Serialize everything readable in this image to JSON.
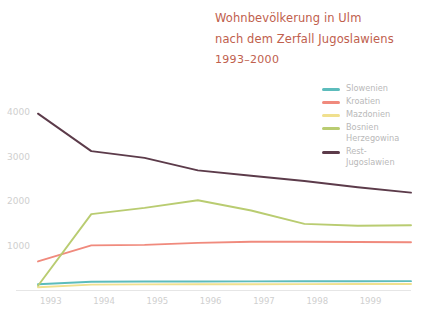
{
  "title": {
    "line1": "Wohnbevölkerung in Ulm",
    "line2": "nach dem Zerfall Jugoslawiens",
    "subtitle": "1993–2000",
    "color": "#c0604d"
  },
  "legend": {
    "position": "top-right",
    "entries": [
      {
        "label": "Slowenien",
        "color": "#5cbcbc"
      },
      {
        "label": "Kroatien",
        "color": "#f08a7d"
      },
      {
        "label": "Mazdonien",
        "color": "#f0e08e"
      },
      {
        "label": "Bosnien\nHerzegowina",
        "color": "#b9cc71"
      },
      {
        "label": "Rest-\nJugoslawien",
        "color": "#5c3b4a"
      }
    ]
  },
  "axes": {
    "y_ticks": [
      "1000",
      "2000",
      "3000",
      "4000"
    ],
    "x_ticks": [
      "1993",
      "1994",
      "1995",
      "1996",
      "1997",
      "1998",
      "1999"
    ],
    "ylim": [
      0,
      4300
    ],
    "xlim": [
      1993,
      2000
    ],
    "grid": false
  },
  "chart_data": {
    "type": "line",
    "title": "Wohnbevölkerung in Ulm nach dem Zerfall Jugoslawiens 1993–2000",
    "xlabel": "",
    "ylabel": "",
    "ylim": [
      0,
      4300
    ],
    "grid": false,
    "legend_position": "top-right",
    "x": [
      1993,
      1994,
      1995,
      1996,
      1997,
      1998,
      1999,
      2000
    ],
    "series": [
      {
        "name": "Slowenien",
        "color": "#5cbcbc",
        "values": [
          130,
          185,
          190,
          192,
          193,
          195,
          196,
          198
        ]
      },
      {
        "name": "Kroatien",
        "color": "#f08a7d",
        "values": [
          640,
          1000,
          1010,
          1055,
          1080,
          1080,
          1075,
          1070
        ]
      },
      {
        "name": "Mazdonien",
        "color": "#f0e08e",
        "values": [
          60,
          120,
          125,
          128,
          130,
          132,
          134,
          136
        ]
      },
      {
        "name": "Bosnien Herzegowina",
        "color": "#b9cc71",
        "values": [
          95,
          1700,
          1840,
          2010,
          1780,
          1480,
          1440,
          1450
        ]
      },
      {
        "name": "Rest-Jugoslawien",
        "color": "#5c3b4a",
        "values": [
          3950,
          3110,
          2960,
          2680,
          2560,
          2440,
          2300,
          2180
        ]
      }
    ]
  }
}
